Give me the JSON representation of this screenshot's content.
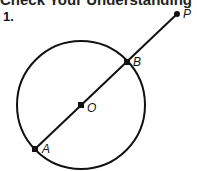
{
  "heading": "Check Your Understanding",
  "problem_number": "1.",
  "figure": {
    "circle": {
      "cx": 81,
      "cy": 105,
      "r": 64
    },
    "points": [
      {
        "name": "P",
        "x": 177,
        "y": 14,
        "label_dx": 6,
        "label_dy": 4
      },
      {
        "name": "B",
        "x": 127,
        "y": 62,
        "label_dx": 6,
        "label_dy": 1
      },
      {
        "name": "O",
        "x": 81,
        "y": 105,
        "label_dx": 6,
        "label_dy": 6
      },
      {
        "name": "A",
        "x": 35,
        "y": 149,
        "label_dx": 7,
        "label_dy": 2
      }
    ],
    "line_color": "#111111"
  },
  "labels": {
    "P": "P",
    "B": "B",
    "O": "O",
    "A": "A"
  }
}
